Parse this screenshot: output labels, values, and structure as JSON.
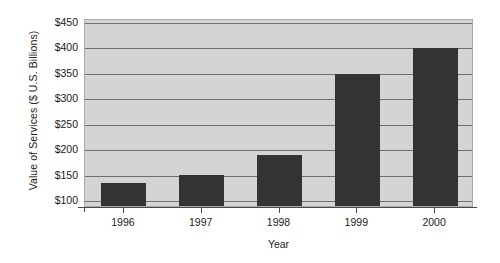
{
  "chart_data": {
    "type": "bar",
    "title": "",
    "xlabel": "Year",
    "ylabel": "Value of Services ($ U.S. Billions)",
    "categories": [
      "1996",
      "1997",
      "1998",
      "1999",
      "2000"
    ],
    "values": [
      132,
      147,
      187,
      345,
      397
    ],
    "ytick_labels": [
      "$450",
      "$400",
      "$350",
      "$300",
      "$250",
      "$200",
      "$150",
      "$100"
    ],
    "ytick_values": [
      450,
      400,
      350,
      300,
      250,
      200,
      150,
      100
    ],
    "ylim": [
      87,
      455
    ],
    "xlim_note": "categorical",
    "grid": "horizontal",
    "legend": "none",
    "bar_color": "#333333",
    "plot_background": "#d4d4d4",
    "gridline_color": "#6e6e6e",
    "axis_color": "#4a4a4a"
  }
}
